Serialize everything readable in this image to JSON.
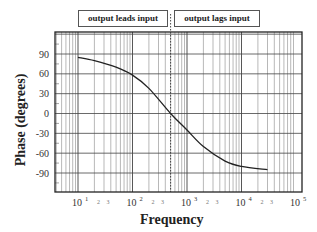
{
  "chart_data": {
    "type": "line",
    "title": "",
    "xlabel": "Frequency",
    "ylabel": "Phase  (degrees)",
    "xscale": "log",
    "xlim": [
      3,
      100000
    ],
    "ylim": [
      -120,
      120
    ],
    "grid": true,
    "x_tick_labels": [
      "10^1",
      "10^2",
      "10^3",
      "10^4",
      "10^5"
    ],
    "x_minor_tick_labels": [
      "2",
      "3"
    ],
    "y_tick_labels": [
      "90",
      "60",
      "30",
      "0",
      "-30",
      "-60",
      "-90"
    ],
    "y_ticks": [
      90,
      60,
      30,
      0,
      -30,
      -60,
      -90
    ],
    "annotations": [
      {
        "text": "output leads input",
        "region": "left of dotted line"
      },
      {
        "text": "output lags input",
        "region": "right of dotted line"
      }
    ],
    "reference_line": {
      "x": 500,
      "style": "dotted",
      "label": "0° crossing"
    },
    "series": [
      {
        "name": "Phase",
        "x": [
          10,
          20,
          50,
          100,
          200,
          500,
          1000,
          2000,
          5000,
          10000,
          30000
        ],
        "values": [
          85,
          80,
          70,
          58,
          38,
          0,
          -25,
          -50,
          -72,
          -80,
          -85
        ]
      }
    ]
  },
  "legend": {
    "left_label": "output leads input",
    "right_label": "output lags input"
  },
  "axes": {
    "xlabel": "Frequency",
    "ylabel": "Phase  (degrees)"
  }
}
